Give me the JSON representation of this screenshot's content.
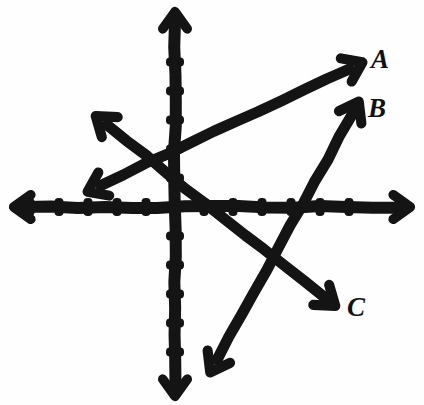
{
  "figure": {
    "background_color": "#fefefe",
    "ink_color": "#141414",
    "width": 424,
    "height": 405
  },
  "axes": {
    "origin": {
      "x": 175,
      "y": 207
    },
    "tick_spacing_px": 29,
    "x_axis": {
      "name": "x-axis",
      "y": 207,
      "start_x": 14,
      "end_x": 410,
      "arrow_left": true,
      "arrow_right": true,
      "ticks_left": [
        146,
        117,
        88,
        59,
        30
      ],
      "ticks_right": [
        204,
        233,
        262,
        291,
        320,
        349
      ],
      "tick_half_height": 9
    },
    "y_axis": {
      "name": "y-axis",
      "x": 175,
      "start_y": 12,
      "end_y": 396,
      "arrow_up": true,
      "arrow_down": true,
      "ticks_up": [
        178,
        149,
        120,
        91,
        62
      ],
      "ticks_down": [
        236,
        265,
        294,
        323,
        352
      ],
      "tick_half_width": 9
    }
  },
  "lines": [
    {
      "id": "line-A",
      "label": "A",
      "label_pos": {
        "x": 371,
        "y": 46
      },
      "from": {
        "x": 89,
        "y": 191
      },
      "to": {
        "x": 361,
        "y": 63
      },
      "arrow_from": true,
      "arrow_to": true,
      "stroke_width": 11,
      "description": "Line A rises from lower-left to upper-right with a shallow positive slope",
      "slope_estimate": 0.47,
      "crosses_x_axis_at_px": 123,
      "crosses_y_axis_at_px": 150
    },
    {
      "id": "line-B",
      "label": "B",
      "label_pos": {
        "x": 368,
        "y": 95
      },
      "from": {
        "x": 211,
        "y": 371
      },
      "to": {
        "x": 358,
        "y": 103
      },
      "arrow_from": true,
      "arrow_to": true,
      "stroke_width": 11,
      "description": "Line B rises steeply from lower-left to upper-right",
      "slope_estimate": 1.82,
      "crosses_x_axis_at_px": 301
    },
    {
      "id": "line-C",
      "label": "C",
      "label_pos": {
        "x": 347,
        "y": 294
      },
      "from": {
        "x": 97,
        "y": 117
      },
      "to": {
        "x": 334,
        "y": 305
      },
      "arrow_from": true,
      "arrow_to": true,
      "stroke_width": 11,
      "description": "Line C descends from upper-left to lower-right with a negative slope",
      "slope_estimate": -0.79,
      "crosses_x_axis_at_px": 209
    }
  ],
  "labels": {
    "A": "A",
    "B": "B",
    "C": "C"
  }
}
